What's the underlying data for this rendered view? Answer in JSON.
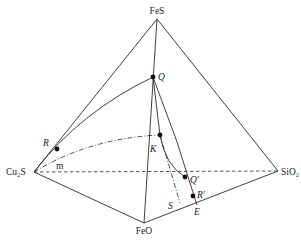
{
  "figure": {
    "type": "tetrahedral phase diagram",
    "vertices": {
      "top": {
        "label": "FeS"
      },
      "left": {
        "label": "Cu₂S"
      },
      "right": {
        "label": "SiO₂"
      },
      "bottom": {
        "label": "FeO"
      }
    },
    "points": {
      "Q": {
        "label": "Q"
      },
      "R": {
        "label": "R"
      },
      "K": {
        "label": "K"
      },
      "Q_prime": {
        "label": "Q′"
      },
      "R_prime": {
        "label": "R′"
      },
      "E": {
        "label": "E"
      },
      "S": {
        "label": "S"
      },
      "m": {
        "label": "m"
      }
    },
    "colors": {
      "line": "#2a2a2a",
      "background": "#ffffff"
    }
  }
}
